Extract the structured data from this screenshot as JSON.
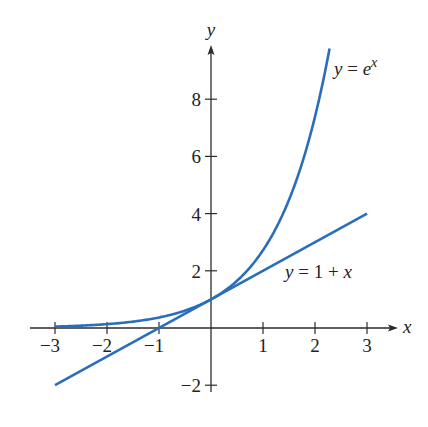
{
  "chart_data": {
    "type": "line",
    "title": "",
    "xlabel": "x",
    "ylabel": "y",
    "xlim": [
      -3,
      3
    ],
    "ylim": [
      -2,
      10
    ],
    "x_ticks": [
      "-3",
      "-2",
      "-1",
      "1",
      "2",
      "3"
    ],
    "y_ticks": [
      "-2",
      "2",
      "4",
      "6",
      "8"
    ],
    "grid": false,
    "legend": "none (inline curve labels)",
    "series": [
      {
        "name": "y = e^x",
        "label_base": "y = e",
        "label_sup": "x",
        "color": "#2a6ebb",
        "x": [
          -3,
          -2.5,
          -2,
          -1.5,
          -1,
          -0.5,
          0,
          0.5,
          1,
          1.5,
          2,
          2.28
        ],
        "y": [
          0.05,
          0.08,
          0.14,
          0.22,
          0.37,
          0.61,
          1,
          1.65,
          2.72,
          4.48,
          7.39,
          9.78
        ]
      },
      {
        "name": "y = 1 + x",
        "label": "y = 1 + x",
        "color": "#2a6ebb",
        "x": [
          -3,
          3
        ],
        "y": [
          -2,
          4
        ]
      }
    ]
  },
  "axes": {
    "x_label": "x",
    "y_label": "y"
  }
}
